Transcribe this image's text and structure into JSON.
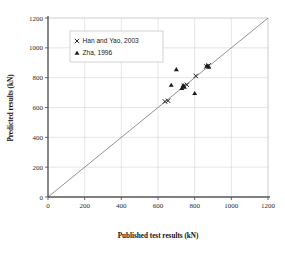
{
  "chart_data": {
    "type": "scatter",
    "title": "",
    "xlabel": "Published test results (kN)",
    "ylabel": "Predicted results (kN)",
    "xlim": [
      0,
      1200
    ],
    "ylim": [
      0,
      1200
    ],
    "xticks": [
      0,
      200,
      400,
      600,
      800,
      1000,
      1200
    ],
    "yticks": [
      0,
      200,
      400,
      600,
      800,
      1000,
      1200
    ],
    "xtick_labels": [
      "0",
      "200",
      "400",
      "600",
      "800",
      "1000",
      "1200"
    ],
    "ytick_labels": [
      "0",
      "200",
      "400",
      "600",
      "800",
      "1000",
      "1200"
    ],
    "grid": true,
    "legend_position": "upper-left-inside",
    "reference_line": {
      "name": "identity-line",
      "from": [
        0,
        0
      ],
      "to": [
        1200,
        1200
      ],
      "color": "#6e6e6e"
    },
    "series": [
      {
        "name": "Han and Yao, 2003",
        "marker": "x",
        "color": "#1c1c1c",
        "points": [
          [
            638,
            640
          ],
          [
            655,
            645
          ],
          [
            740,
            745
          ],
          [
            757,
            752
          ],
          [
            806,
            812
          ],
          [
            864,
            875
          ],
          [
            876,
            882
          ]
        ]
      },
      {
        "name": "Zha, 1996",
        "marker": "triangle",
        "color": "#1c1c1c",
        "points": [
          [
            672,
            750
          ],
          [
            700,
            855
          ],
          [
            730,
            728
          ],
          [
            737,
            748
          ],
          [
            744,
            738
          ],
          [
            800,
            695
          ],
          [
            866,
            880
          ],
          [
            876,
            872
          ]
        ]
      }
    ]
  },
  "axes": {
    "x_title": "Published test results (kN)",
    "y_title": "Predicted results (kN)"
  },
  "legend": {
    "entries": [
      {
        "marker_icon": "x-marker-icon",
        "label": "Han and Yao, 2003"
      },
      {
        "marker_icon": "triangle-marker-icon",
        "label": "Zha, 1996"
      }
    ]
  },
  "ticks": {
    "x": [
      "0",
      "200",
      "400",
      "600",
      "800",
      "1000",
      "1200"
    ],
    "y": [
      "0",
      "200",
      "400",
      "600",
      "800",
      "1000",
      "1200"
    ]
  },
  "colors": {
    "marker": "#1c1c1c",
    "grid": "#d2d2d2",
    "axis": "#555555",
    "reference_line": "#6e6e6e",
    "background": "#ffffff"
  }
}
